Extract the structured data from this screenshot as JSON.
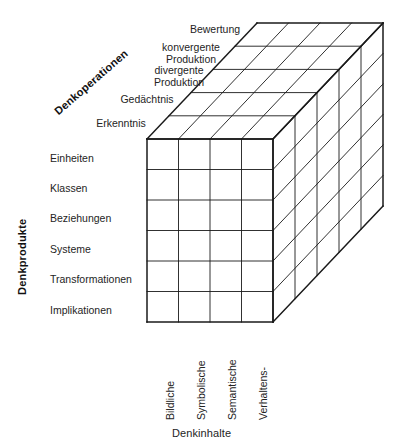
{
  "diagram": {
    "title_semantic": "guilford-structure-of-intellect-cube",
    "line_color": "#1a1a1a",
    "face_color": "#ffffff"
  },
  "axes": {
    "operations_title": "Denkoperationen",
    "products_title": "Denkprodukte",
    "contents_title": "Denkinhalte"
  },
  "operations": [
    {
      "label": "Bewertung",
      "lines": [
        "Bewertung"
      ]
    },
    {
      "label": "konvergente Produktion",
      "lines": [
        "konvergente",
        "Produktion"
      ]
    },
    {
      "label": "divergente Produktion",
      "lines": [
        "divergente",
        "Produktion"
      ]
    },
    {
      "label": "Gedächtnis",
      "lines": [
        "Gedächtnis"
      ]
    },
    {
      "label": "Erkenntnis",
      "lines": [
        "Erkenntnis"
      ]
    }
  ],
  "products": [
    "Einheiten",
    "Klassen",
    "Beziehungen",
    "Systeme",
    "Transformationen",
    "Implikationen"
  ],
  "contents": [
    "Bildliche",
    "Symbolische",
    "Semantische",
    "Verhaltens-"
  ],
  "geometry": {
    "front_left_x": 147,
    "front_top_y": 139,
    "front_right_x": 273,
    "front_bottom_y": 322,
    "depth_dx": 110,
    "depth_dy": -116,
    "columns": 4,
    "rows": 6,
    "depth_slices": 5
  }
}
